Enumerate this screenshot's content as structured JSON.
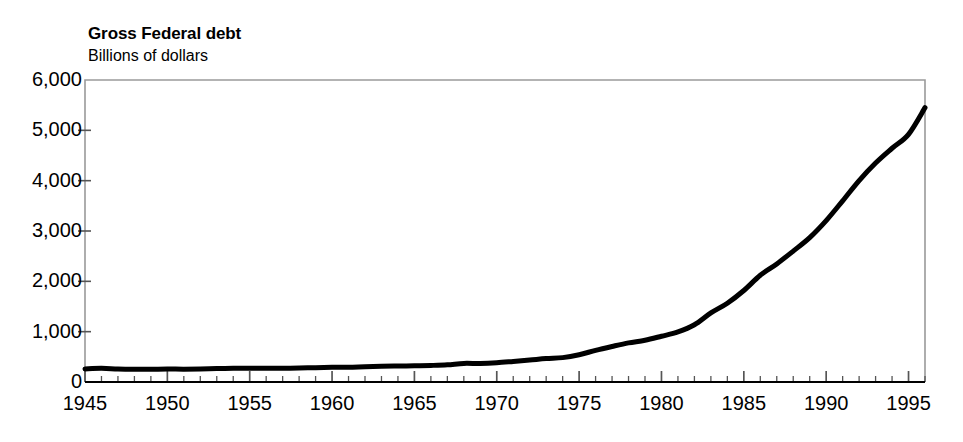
{
  "chart_data": {
    "type": "line",
    "title": "Gross Federal debt",
    "subtitle": "Billions of dollars",
    "xlabel": "",
    "ylabel": "Billions of dollars",
    "xlim": [
      1945,
      1996
    ],
    "ylim": [
      0,
      6000
    ],
    "grid": false,
    "legend": null,
    "y_ticks": [
      {
        "value": 6000,
        "label": "6,000"
      },
      {
        "value": 5000,
        "label": "5,000"
      },
      {
        "value": 4000,
        "label": "4,000"
      },
      {
        "value": 3000,
        "label": "3,000"
      },
      {
        "value": 2000,
        "label": "2,000"
      },
      {
        "value": 1000,
        "label": "1,000"
      },
      {
        "value": 0,
        "label": "0"
      }
    ],
    "x_major_ticks": [
      {
        "value": 1945,
        "label": "1945"
      },
      {
        "value": 1950,
        "label": "1950"
      },
      {
        "value": 1955,
        "label": "1955"
      },
      {
        "value": 1960,
        "label": "1960"
      },
      {
        "value": 1965,
        "label": "1965"
      },
      {
        "value": 1970,
        "label": "1970"
      },
      {
        "value": 1975,
        "label": "1975"
      },
      {
        "value": 1980,
        "label": "1980"
      },
      {
        "value": 1985,
        "label": "1985"
      },
      {
        "value": 1990,
        "label": "1990"
      },
      {
        "value": 1995,
        "label": "1995"
      }
    ],
    "x_minor_tick_interval": 1,
    "series": [
      {
        "name": "Gross Federal debt",
        "color": "#000000",
        "line_width": 5,
        "x": [
          1945,
          1946,
          1947,
          1948,
          1949,
          1950,
          1951,
          1952,
          1953,
          1954,
          1955,
          1956,
          1957,
          1958,
          1959,
          1960,
          1961,
          1962,
          1963,
          1964,
          1965,
          1966,
          1967,
          1968,
          1969,
          1970,
          1971,
          1972,
          1973,
          1974,
          1975,
          1976,
          1977,
          1978,
          1979,
          1980,
          1981,
          1982,
          1983,
          1984,
          1985,
          1986,
          1987,
          1988,
          1989,
          1990,
          1991,
          1992,
          1993,
          1994,
          1995,
          1996
        ],
        "values": [
          260,
          271,
          257,
          252,
          253,
          257,
          255,
          259,
          266,
          271,
          274,
          273,
          271,
          276,
          285,
          291,
          293,
          303,
          311,
          317,
          323,
          329,
          341,
          370,
          367,
          381,
          408,
          436,
          466,
          484,
          541,
          629,
          706,
          777,
          829,
          909,
          995,
          1137,
          1372,
          1565,
          1818,
          2120,
          2346,
          2601,
          2868,
          3206,
          3599,
          4002,
          4351,
          4644,
          4921,
          5450
        ]
      }
    ]
  },
  "axes": {
    "frame_color": "#9a9a9a",
    "baseline_color": "#000000",
    "tick_color": "#555555"
  }
}
